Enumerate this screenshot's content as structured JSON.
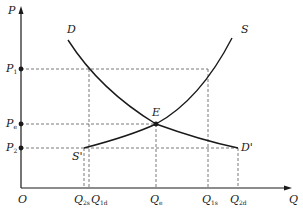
{
  "diagram": {
    "type": "supply-demand",
    "axes": {
      "y_label": "P",
      "x_label": "Q",
      "origin_label": "O"
    },
    "price_levels": [
      {
        "main": "P",
        "sub": "1"
      },
      {
        "main": "P",
        "sub": "e"
      },
      {
        "main": "P",
        "sub": "2"
      }
    ],
    "quantity_levels": [
      {
        "main": "Q",
        "sub": "2s"
      },
      {
        "main": "Q",
        "sub": "1d"
      },
      {
        "main": "Q",
        "sub": "e"
      },
      {
        "main": "Q",
        "sub": "1s"
      },
      {
        "main": "Q",
        "sub": "2d"
      }
    ],
    "curves": {
      "demand": "D",
      "supply": "S",
      "supply_end": "S'",
      "demand_end": "D'"
    },
    "equilibrium_label": "E",
    "colors": {
      "curve": "#1a1a1a",
      "guide": "#555555",
      "axis": "#1a1a1a"
    }
  }
}
